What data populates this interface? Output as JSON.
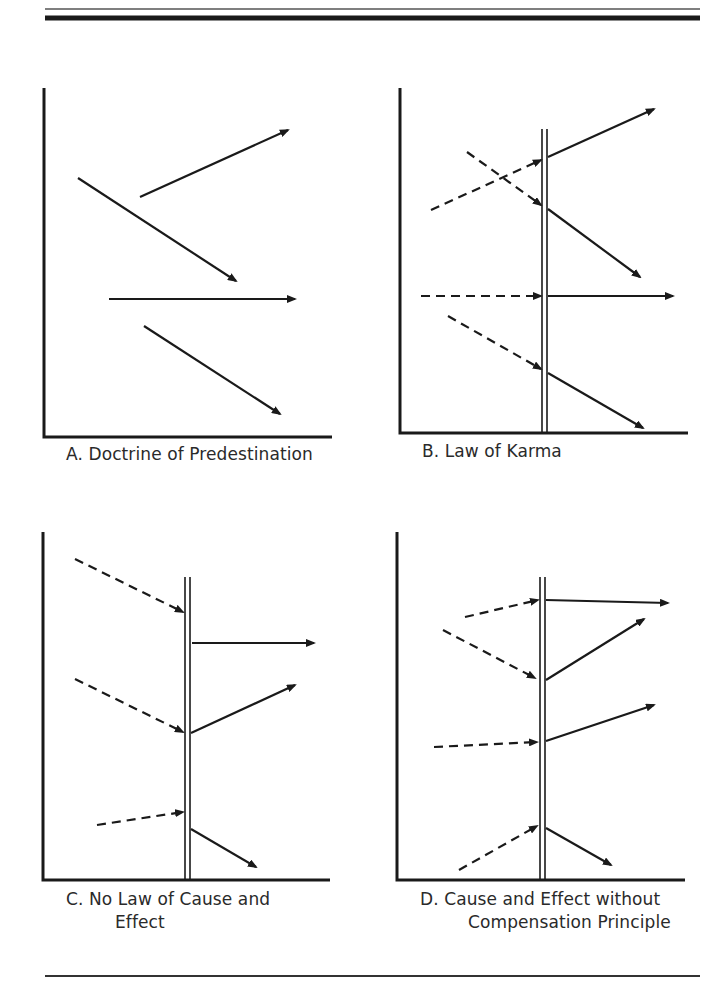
{
  "figure": {
    "rules": {
      "top_thin_y": 9,
      "top_thick_y": 18,
      "bottom_y": 976,
      "x1": 45,
      "x2": 700
    },
    "colors": {
      "ink": "#1a1a1a",
      "background": "#ffffff"
    },
    "panels": [
      {
        "id": "A",
        "caption_line1": "A.  Doctrine of Predestination",
        "caption_line2": "",
        "axes": {
          "x0": 44,
          "ytop": 88,
          "ybottom": 437,
          "xright": 332
        },
        "barrier": null,
        "arrows": [
          {
            "style": "solid",
            "from": [
              140,
              197
            ],
            "to": [
              288,
              130
            ]
          },
          {
            "style": "solid",
            "from": [
              78,
              178
            ],
            "to": [
              236,
              281
            ]
          },
          {
            "style": "solid",
            "from": [
              109,
              299
            ],
            "to": [
              295,
              299
            ]
          },
          {
            "style": "solid",
            "from": [
              144,
              326
            ],
            "to": [
              280,
              414
            ]
          }
        ]
      },
      {
        "id": "B",
        "caption_line1": "B.  Law of Karma",
        "caption_line2": "",
        "axes": {
          "x0": 400,
          "ytop": 88,
          "ybottom": 433,
          "xright": 688
        },
        "barrier": {
          "x1": 542,
          "x2": 547,
          "ytop": 129,
          "ybottom": 433
        },
        "arrows": [
          {
            "style": "dashed",
            "from": [
              431,
              210
            ],
            "to": [
              541,
              160
            ]
          },
          {
            "style": "solid",
            "from": [
              548,
              157
            ],
            "to": [
              654,
              109
            ]
          },
          {
            "style": "dashed",
            "from": [
              467,
              152
            ],
            "to": [
              541,
              205
            ]
          },
          {
            "style": "solid",
            "from": [
              548,
              209
            ],
            "to": [
              640,
              277
            ]
          },
          {
            "style": "dashed",
            "from": [
              421,
              296
            ],
            "to": [
              541,
              296
            ]
          },
          {
            "style": "solid",
            "from": [
              548,
              296
            ],
            "to": [
              673,
              296
            ]
          },
          {
            "style": "dashed",
            "from": [
              448,
              316
            ],
            "to": [
              541,
              369
            ]
          },
          {
            "style": "solid",
            "from": [
              548,
              373
            ],
            "to": [
              643,
              428
            ]
          }
        ]
      },
      {
        "id": "C",
        "caption_line1": "C.  No Law of Cause and",
        "caption_line2": "Effect",
        "axes": {
          "x0": 43,
          "ytop": 532,
          "ybottom": 880,
          "xright": 330
        },
        "barrier": {
          "x1": 185,
          "x2": 190,
          "ytop": 577,
          "ybottom": 880
        },
        "arrows": [
          {
            "style": "dashed",
            "from": [
              75,
              559
            ],
            "to": [
              183,
              612
            ]
          },
          {
            "style": "solid",
            "from": [
              192,
              643
            ],
            "to": [
              314,
              643
            ]
          },
          {
            "style": "dashed",
            "from": [
              75,
              679
            ],
            "to": [
              183,
              732
            ]
          },
          {
            "style": "solid",
            "from": [
              191,
              733
            ],
            "to": [
              295,
              685
            ]
          },
          {
            "style": "dashed",
            "from": [
              97,
              825
            ],
            "to": [
              183,
              812
            ]
          },
          {
            "style": "solid",
            "from": [
              191,
              829
            ],
            "to": [
              256,
              867
            ]
          }
        ]
      },
      {
        "id": "D",
        "caption_line1": "D.  Cause and Effect without",
        "caption_line2": "Compensation Principle",
        "axes": {
          "x0": 397,
          "ytop": 532,
          "ybottom": 880,
          "xright": 685
        },
        "barrier": {
          "x1": 540,
          "x2": 545,
          "ytop": 577,
          "ybottom": 880
        },
        "arrows": [
          {
            "style": "dashed",
            "from": [
              465,
              617
            ],
            "to": [
              538,
              600
            ]
          },
          {
            "style": "solid",
            "from": [
              546,
              600
            ],
            "to": [
              668,
              603
            ]
          },
          {
            "style": "dashed",
            "from": [
              443,
              630
            ],
            "to": [
              535,
              678
            ]
          },
          {
            "style": "solid",
            "from": [
              546,
              680
            ],
            "to": [
              644,
              619
            ]
          },
          {
            "style": "dashed",
            "from": [
              434,
              747
            ],
            "to": [
              537,
              742
            ]
          },
          {
            "style": "solid",
            "from": [
              546,
              741
            ],
            "to": [
              654,
              705
            ]
          },
          {
            "style": "dashed",
            "from": [
              459,
              870
            ],
            "to": [
              537,
              826
            ]
          },
          {
            "style": "solid",
            "from": [
              546,
              828
            ],
            "to": [
              611,
              865
            ]
          }
        ]
      }
    ]
  }
}
